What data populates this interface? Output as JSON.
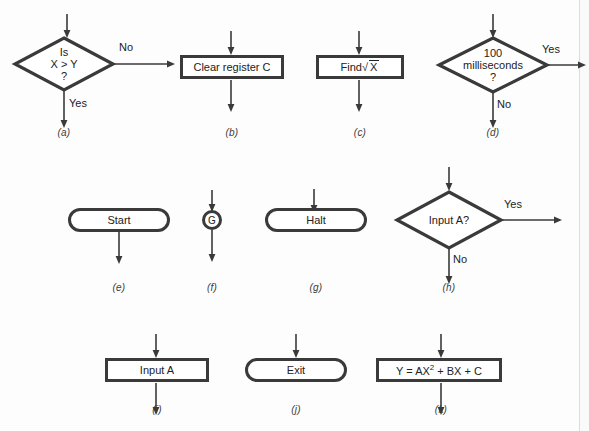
{
  "figure": {
    "line_color": "#3a3a3a",
    "text_color": "#222222",
    "background": "#fdfdfd"
  },
  "items": [
    {
      "key": "a",
      "caption": "(a)",
      "shape": "decision",
      "text_lines": [
        "Is",
        "X > Y",
        "?"
      ],
      "branch_right_label": "No",
      "branch_down_label": "Yes",
      "has_input_arrow": true
    },
    {
      "key": "b",
      "caption": "(b)",
      "shape": "process",
      "text": "Clear register C",
      "has_input_arrow": true,
      "has_output_arrow": true
    },
    {
      "key": "c",
      "caption": "(c)",
      "shape": "process",
      "text": "Find √X",
      "text_prefix": "Find",
      "text_radical": "√",
      "text_radicand": "X",
      "has_input_arrow": true,
      "has_output_arrow": true
    },
    {
      "key": "d",
      "caption": "(d)",
      "shape": "decision",
      "text_lines": [
        "100",
        "milliseconds",
        "?"
      ],
      "branch_right_label": "Yes",
      "branch_down_label": "No",
      "has_input_arrow": true
    },
    {
      "key": "e",
      "caption": "(e)",
      "shape": "terminal",
      "text": "Start",
      "has_input_arrow": false,
      "has_output_arrow": true
    },
    {
      "key": "f",
      "caption": "(f)",
      "shape": "connector",
      "text": "G",
      "has_input_arrow": true,
      "has_output_arrow": true
    },
    {
      "key": "g",
      "caption": "(g)",
      "shape": "terminal",
      "text": "Halt",
      "has_input_arrow": true,
      "has_output_arrow": false
    },
    {
      "key": "h",
      "caption": "(h)",
      "shape": "decision",
      "text_lines": [
        "Input A?"
      ],
      "branch_right_label": "Yes",
      "branch_down_label": "No",
      "has_input_arrow": true
    },
    {
      "key": "i",
      "caption": "(i)",
      "shape": "process",
      "text": "Input A",
      "has_input_arrow": true,
      "has_output_arrow": true
    },
    {
      "key": "j",
      "caption": "(j)",
      "shape": "terminal",
      "text": "Exit",
      "has_input_arrow": true,
      "has_output_arrow": false
    },
    {
      "key": "k",
      "caption": "(k)",
      "shape": "process",
      "text": "Y = AX2 + BX + C",
      "text_before_sup": "Y = AX",
      "text_sup": "2",
      "text_after_sup": " + BX + C",
      "has_input_arrow": true,
      "has_output_arrow": true
    }
  ]
}
